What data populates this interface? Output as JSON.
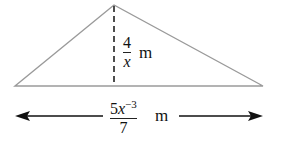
{
  "figure": {
    "shape": "triangle",
    "height_label": {
      "numerator": "4",
      "denominator": "x",
      "unit": "m"
    },
    "base_label": {
      "coefficient": "5",
      "variable": "x",
      "exponent": "−3",
      "denominator": "7",
      "unit": "m"
    },
    "colors": {
      "triangle_stroke": "#9a9a9a",
      "height_stroke": "#222222",
      "arrow": "#111111"
    }
  }
}
